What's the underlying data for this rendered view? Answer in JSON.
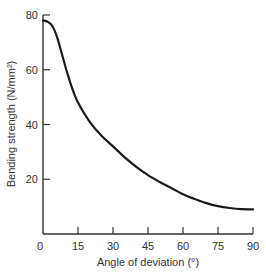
{
  "chart_data": {
    "type": "line",
    "title": "",
    "xlabel": "Angle of deviation (°)",
    "ylabel": "Bending strength (N/mm²)",
    "xlim": [
      0,
      90
    ],
    "ylim": [
      0,
      80
    ],
    "x_ticks": [
      0,
      15,
      30,
      45,
      60,
      75,
      90
    ],
    "y_ticks": [
      20,
      40,
      60,
      80
    ],
    "grid": false,
    "legend": null,
    "series": [
      {
        "name": "Bending strength",
        "x": [
          0,
          2,
          4,
          6,
          8,
          10,
          12,
          15,
          20,
          25,
          30,
          35,
          40,
          45,
          50,
          55,
          60,
          65,
          70,
          75,
          80,
          85,
          90
        ],
        "values": [
          78,
          77.5,
          76,
          72,
          66,
          60,
          54.5,
          48,
          41,
          36,
          32,
          28,
          24.5,
          21.5,
          19,
          16.8,
          14.5,
          12.8,
          11.3,
          10.2,
          9.5,
          9.1,
          9
        ]
      }
    ],
    "colors": {
      "line": "#1a1a1a",
      "axis": "#333333"
    }
  }
}
